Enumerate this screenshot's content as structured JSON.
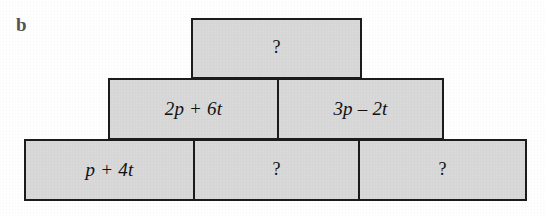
{
  "figure": {
    "part_label": "b",
    "type": "algebra-pyramid",
    "rows": [
      {
        "level": "top",
        "cells": [
          {
            "text": "?",
            "is_unknown": true
          }
        ]
      },
      {
        "level": "middle",
        "cells": [
          {
            "text": "2p + 6t",
            "is_unknown": false
          },
          {
            "text": "3p – 2t",
            "is_unknown": false
          }
        ]
      },
      {
        "level": "bottom",
        "cells": [
          {
            "text": "p + 4t",
            "is_unknown": false
          },
          {
            "text": "?",
            "is_unknown": true
          },
          {
            "text": "?",
            "is_unknown": true
          }
        ]
      }
    ]
  },
  "colors": {
    "brick_fill": "#d9d9d9",
    "brick_border": "#1c1c1c",
    "text": "#111111",
    "label_text": "#555555",
    "background": "#ffffff"
  }
}
